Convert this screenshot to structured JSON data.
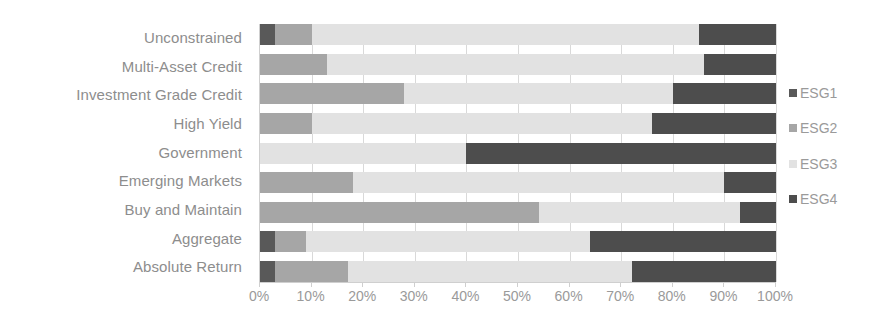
{
  "chart_data": {
    "type": "bar",
    "orientation": "horizontal",
    "stacked": true,
    "stack_mode": "100%",
    "title": "",
    "subtitle": "",
    "xlabel": "",
    "ylabel": "",
    "xlim": [
      0,
      100
    ],
    "xtick_labels": [
      "0%",
      "10%",
      "20%",
      "30%",
      "40%",
      "50%",
      "60%",
      "70%",
      "80%",
      "90%",
      "100%"
    ],
    "xtick_values": [
      0,
      10,
      20,
      30,
      40,
      50,
      60,
      70,
      80,
      90,
      100
    ],
    "grid": "vertical",
    "legend_position": "right",
    "categories": [
      "Unconstrained",
      "Multi-Asset Credit",
      "Investment Grade Credit",
      "High Yield",
      "Government",
      "Emerging Markets",
      "Buy and Maintain",
      "Aggregate",
      "Absolute Return"
    ],
    "series": [
      {
        "name": "ESG1",
        "color": "#595959",
        "values": [
          3,
          0,
          0,
          0,
          0,
          0,
          0,
          3,
          3
        ]
      },
      {
        "name": "ESG2",
        "color": "#a6a6a6",
        "values": [
          7,
          13,
          28,
          10,
          0,
          18,
          54,
          6,
          14
        ]
      },
      {
        "name": "ESG3",
        "color": "#e2e2e2",
        "values": [
          75,
          73,
          52,
          66,
          40,
          72,
          39,
          55,
          55
        ]
      },
      {
        "name": "ESG4",
        "color": "#4d4d4d",
        "values": [
          15,
          14,
          20,
          24,
          60,
          10,
          7,
          36,
          28
        ]
      }
    ]
  },
  "legend": {
    "items": [
      {
        "label": "ESG1",
        "color": "#595959"
      },
      {
        "label": "ESG2",
        "color": "#a6a6a6"
      },
      {
        "label": "ESG3",
        "color": "#e2e2e2"
      },
      {
        "label": "ESG4",
        "color": "#4d4d4d"
      }
    ]
  },
  "colors": {
    "esg1": "#595959",
    "esg2": "#a6a6a6",
    "esg3": "#e2e2e2",
    "esg4": "#4d4d4d",
    "axis_text": "#9a9a9a",
    "category_text": "#8d8d8d",
    "gridline": "#d9d9d9",
    "background": "#ffffff"
  }
}
